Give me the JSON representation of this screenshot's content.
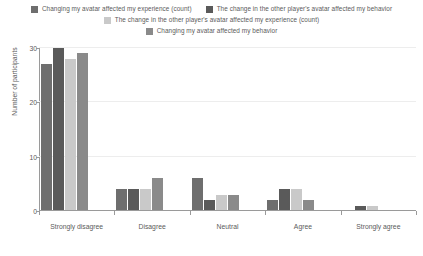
{
  "chart_data": {
    "type": "bar",
    "title": "",
    "xlabel": "",
    "ylabel": "Number of participants",
    "ylim": [
      0,
      30
    ],
    "yticks": [
      0,
      10,
      20,
      30
    ],
    "grid": true,
    "legend_position": "top",
    "categories": [
      "Strongly disagree",
      "Disagree",
      "Neutral",
      "Agree",
      "Strongly agree"
    ],
    "series": [
      {
        "name": "Changing my avatar affected my experience (count)",
        "color": "#6e6e6e",
        "values": [
          27,
          4,
          6,
          2,
          0
        ]
      },
      {
        "name": "The change in the other player's avatar affected my behavior",
        "color": "#5a5a5a",
        "values": [
          30,
          4,
          2,
          4,
          1
        ]
      },
      {
        "name": "The change in the other player's avatar affected my experience (count)",
        "color": "#c9c9c9",
        "values": [
          28,
          4,
          3,
          4,
          1
        ]
      },
      {
        "name": "Changing my avatar affected my behavior",
        "color": "#8a8a8a",
        "values": [
          29,
          6,
          3,
          2,
          0
        ]
      }
    ]
  },
  "legend_rows": [
    [
      0,
      1
    ],
    [
      2
    ],
    [
      3
    ]
  ],
  "axis": {
    "tick_color": "#9a9a9a",
    "grid_color": "#ededed",
    "text_color": "#5b5b5b"
  }
}
